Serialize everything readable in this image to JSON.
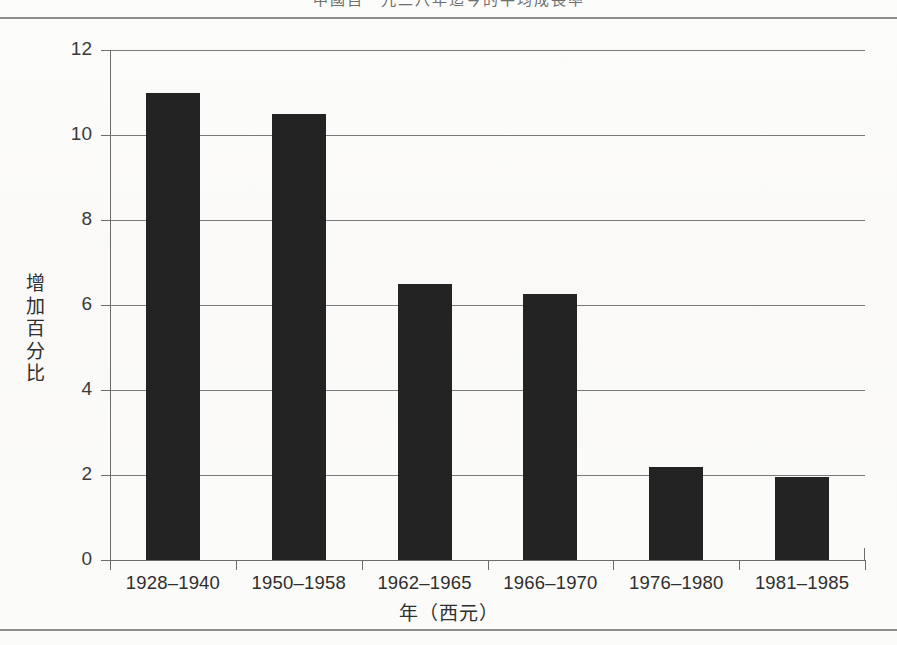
{
  "page": {
    "clipped_header_title": "中國自一九二八年迄今的平均成長率"
  },
  "chart_data": {
    "type": "bar",
    "title": "",
    "xlabel": "年（西元）",
    "ylabel": "增加百分比",
    "categories": [
      "1928–1940",
      "1950–1958",
      "1962–1965",
      "1966–1970",
      "1976–1980",
      "1981–1985"
    ],
    "values": [
      11.0,
      10.5,
      6.5,
      6.25,
      2.2,
      1.95
    ],
    "ylim": [
      0,
      12
    ],
    "ytick_labels": [
      "0",
      "2",
      "4",
      "6",
      "8",
      "10",
      "12"
    ],
    "ytick_values": [
      0,
      2,
      4,
      6,
      8,
      10,
      12
    ],
    "grid": true,
    "legend": "none",
    "bar_color": "#232323",
    "axis_color": "#6d6d6d",
    "grid_color": "#7a7a7a"
  }
}
